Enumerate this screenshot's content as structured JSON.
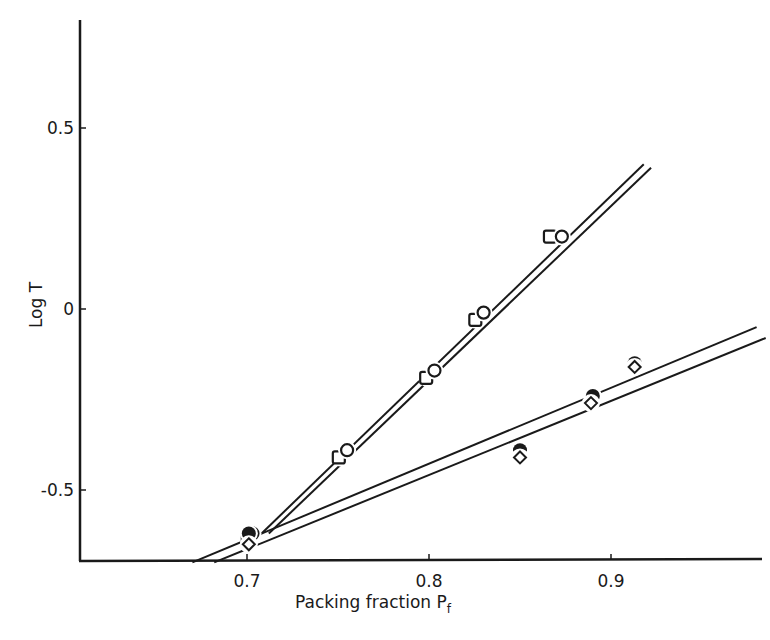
{
  "chart_data": {
    "type": "scatter",
    "title": "",
    "xlabel": "Packing fraction P",
    "xlabel_subscript": "f",
    "ylabel": "Log T",
    "xlim": [
      0.61,
      0.985
    ],
    "ylim": [
      -0.7,
      0.78
    ],
    "x_ticks": [
      0.7,
      0.8,
      0.9
    ],
    "x_tick_labels": [
      "0.7",
      "0.8",
      "0.9"
    ],
    "y_ticks": [
      0.5,
      0,
      -0.5
    ],
    "y_tick_labels": [
      "0.5",
      "0",
      "-0.5"
    ],
    "grid": false,
    "legend": null,
    "series": [
      {
        "name": "open squares (upper)",
        "marker": "open-square",
        "points": [
          [
            0.701,
            -0.64
          ],
          [
            0.751,
            -0.41
          ],
          [
            0.799,
            -0.19
          ],
          [
            0.826,
            -0.03
          ],
          [
            0.867,
            0.2
          ]
        ]
      },
      {
        "name": "open circles (upper)",
        "marker": "open-circle",
        "points": [
          [
            0.703,
            -0.62
          ],
          [
            0.755,
            -0.39
          ],
          [
            0.803,
            -0.17
          ],
          [
            0.83,
            -0.01
          ],
          [
            0.873,
            0.2
          ]
        ]
      },
      {
        "name": "filled circles (lower)",
        "marker": "filled-circle",
        "points": [
          [
            0.701,
            -0.62
          ],
          [
            0.85,
            -0.39
          ],
          [
            0.89,
            -0.24
          ],
          [
            0.913,
            -0.15
          ]
        ]
      },
      {
        "name": "open diamonds (lower)",
        "marker": "open-diamond",
        "points": [
          [
            0.701,
            -0.65
          ],
          [
            0.85,
            -0.41
          ],
          [
            0.889,
            -0.26
          ],
          [
            0.913,
            -0.16
          ]
        ]
      }
    ],
    "fit_lines": [
      {
        "name": "upper fit A",
        "from": [
          0.708,
          -0.62
        ],
        "to": [
          0.918,
          0.4
        ]
      },
      {
        "name": "upper fit B",
        "from": [
          0.712,
          -0.62
        ],
        "to": [
          0.922,
          0.39
        ]
      },
      {
        "name": "lower fit A",
        "from": [
          0.67,
          -0.7
        ],
        "to": [
          0.98,
          -0.05
        ]
      },
      {
        "name": "lower fit B",
        "from": [
          0.682,
          -0.7
        ],
        "to": [
          0.985,
          -0.08
        ]
      }
    ]
  }
}
